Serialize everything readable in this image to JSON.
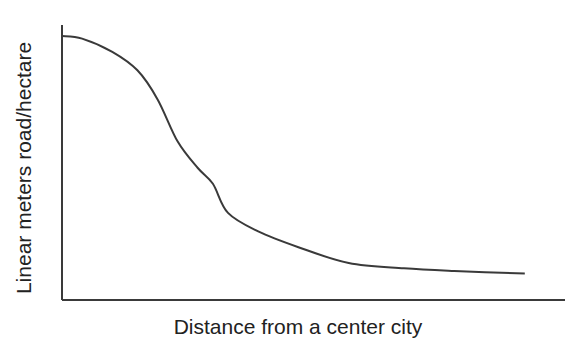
{
  "chart_data": {
    "type": "line",
    "title": "",
    "xlabel": "Distance from a center city",
    "ylabel": "Linear meters road/hectare",
    "x_ticks": [],
    "y_ticks": [],
    "grid": false,
    "legend": null,
    "xlim": [
      0,
      1
    ],
    "ylim": [
      0,
      1
    ],
    "series": [
      {
        "name": "road density",
        "x": [
          0.0,
          0.04,
          0.1,
          0.15,
          0.19,
          0.23,
          0.27,
          0.3,
          0.33,
          0.39,
          0.47,
          0.57,
          0.68,
          0.78,
          0.92
        ],
        "y": [
          1.0,
          0.99,
          0.94,
          0.87,
          0.76,
          0.6,
          0.5,
          0.44,
          0.33,
          0.26,
          0.2,
          0.14,
          0.12,
          0.11,
          0.1
        ]
      }
    ],
    "annotations": []
  },
  "colors": {
    "line": "#3a3a3a",
    "axis": "#3a3a3a",
    "text": "#222222"
  }
}
